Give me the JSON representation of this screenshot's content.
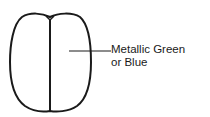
{
  "diagram": {
    "label_line1": "Metallic Green",
    "label_line2": "or Blue",
    "stroke_color": "#1a1a1a",
    "background": "#ffffff"
  }
}
